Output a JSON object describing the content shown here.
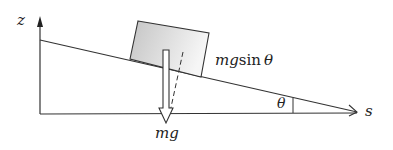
{
  "diagram": {
    "type": "inclined-plane-force-diagram",
    "axes": {
      "vertical_label": "z",
      "horizontal_label": "s"
    },
    "labels": {
      "weight": "mg",
      "component_prefix": "mg",
      "component_func": "sin",
      "component_angle": "θ",
      "angle": "θ"
    },
    "colors": {
      "line": "#333333",
      "block_fill_light": "#f4f4f4",
      "block_fill_dark": "#c8c8c8",
      "arrow_fill": "#ffffff"
    }
  }
}
